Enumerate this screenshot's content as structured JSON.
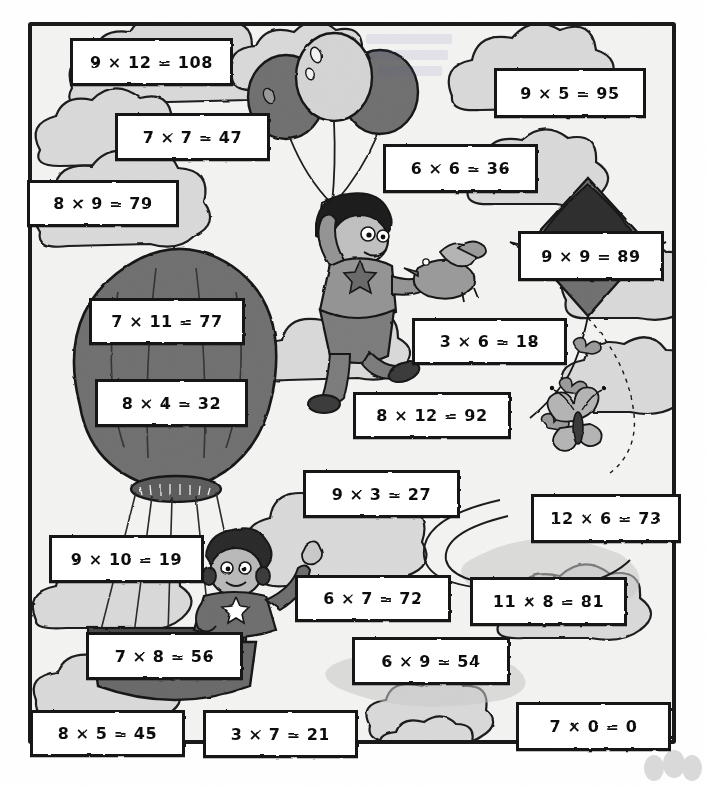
{
  "worksheet": {
    "title": "Multiplication Practice Worksheet",
    "theme": "sky scene with clouds, hot air balloon, kite, balloons, children",
    "frame_color": "#1a1a1a",
    "box_fill": "#ffffff",
    "box_border": "#141414",
    "cloud_fill": "#d7d7d7",
    "cloud_shadow": "#bdbdbd",
    "dark_gray": "#6f6f6f",
    "mid_gray": "#9a9a9a",
    "ink": "#111111"
  },
  "problems": [
    {
      "id": "p1",
      "text": "9 × 12 = 108",
      "a": 9,
      "b": 12,
      "answer": 108,
      "correct": true,
      "x": 70,
      "y": 38,
      "w": 163,
      "h": 48
    },
    {
      "id": "p2",
      "text": "9 × 5 = 95",
      "a": 9,
      "b": 5,
      "answer": 95,
      "correct": false,
      "x": 494,
      "y": 68,
      "w": 152,
      "h": 50
    },
    {
      "id": "p3",
      "text": "7 × 7 = 47",
      "a": 7,
      "b": 7,
      "answer": 47,
      "correct": false,
      "x": 115,
      "y": 113,
      "w": 155,
      "h": 48
    },
    {
      "id": "p4",
      "text": "6 × 6 = 36",
      "a": 6,
      "b": 6,
      "answer": 36,
      "correct": true,
      "x": 383,
      "y": 144,
      "w": 155,
      "h": 49
    },
    {
      "id": "p5",
      "text": "8 × 9 = 79",
      "a": 8,
      "b": 9,
      "answer": 79,
      "correct": false,
      "x": 27,
      "y": 180,
      "w": 152,
      "h": 47
    },
    {
      "id": "p6",
      "text": "9 × 9 = 89",
      "a": 9,
      "b": 9,
      "answer": 89,
      "correct": false,
      "x": 518,
      "y": 231,
      "w": 146,
      "h": 50
    },
    {
      "id": "p7",
      "text": "7 × 11 = 77",
      "a": 7,
      "b": 11,
      "answer": 77,
      "correct": true,
      "x": 89,
      "y": 298,
      "w": 156,
      "h": 47
    },
    {
      "id": "p8",
      "text": "3 × 6 = 18",
      "a": 3,
      "b": 6,
      "answer": 18,
      "correct": true,
      "x": 412,
      "y": 318,
      "w": 155,
      "h": 47
    },
    {
      "id": "p9",
      "text": "8 × 4 = 32",
      "a": 8,
      "b": 4,
      "answer": 32,
      "correct": true,
      "x": 95,
      "y": 379,
      "w": 153,
      "h": 48
    },
    {
      "id": "p10",
      "text": "8 × 12 = 92",
      "a": 8,
      "b": 12,
      "answer": 92,
      "correct": false,
      "x": 353,
      "y": 392,
      "w": 158,
      "h": 47
    },
    {
      "id": "p11",
      "text": "9 × 3 = 27",
      "a": 9,
      "b": 3,
      "answer": 27,
      "correct": true,
      "x": 303,
      "y": 470,
      "w": 157,
      "h": 48
    },
    {
      "id": "p12",
      "text": "12 × 6 = 73",
      "a": 12,
      "b": 6,
      "answer": 73,
      "correct": false,
      "x": 531,
      "y": 494,
      "w": 150,
      "h": 49
    },
    {
      "id": "p13",
      "text": "9 × 10 = 19",
      "a": 9,
      "b": 10,
      "answer": 19,
      "correct": false,
      "x": 49,
      "y": 535,
      "w": 155,
      "h": 48
    },
    {
      "id": "p14",
      "text": "6 × 7 = 72",
      "a": 6,
      "b": 7,
      "answer": 72,
      "correct": false,
      "x": 295,
      "y": 575,
      "w": 156,
      "h": 47
    },
    {
      "id": "p15",
      "text": "11 × 8 = 81",
      "a": 11,
      "b": 8,
      "answer": 81,
      "correct": false,
      "x": 470,
      "y": 577,
      "w": 157,
      "h": 49
    },
    {
      "id": "p16",
      "text": "7 × 8 = 56",
      "a": 7,
      "b": 8,
      "answer": 56,
      "correct": true,
      "x": 86,
      "y": 632,
      "w": 157,
      "h": 48
    },
    {
      "id": "p17",
      "text": "6 × 9 = 54",
      "a": 6,
      "b": 9,
      "answer": 54,
      "correct": true,
      "x": 352,
      "y": 637,
      "w": 158,
      "h": 48
    },
    {
      "id": "p18",
      "text": "8 × 5 = 45",
      "a": 8,
      "b": 5,
      "answer": 45,
      "correct": false,
      "x": 30,
      "y": 710,
      "w": 155,
      "h": 47
    },
    {
      "id": "p19",
      "text": "3 × 7 = 21",
      "a": 3,
      "b": 7,
      "answer": 21,
      "correct": true,
      "x": 203,
      "y": 710,
      "w": 155,
      "h": 48
    },
    {
      "id": "p20",
      "text": "7 × 0 = 0",
      "a": 7,
      "b": 0,
      "answer": 0,
      "correct": true,
      "x": 516,
      "y": 702,
      "w": 155,
      "h": 49
    }
  ]
}
